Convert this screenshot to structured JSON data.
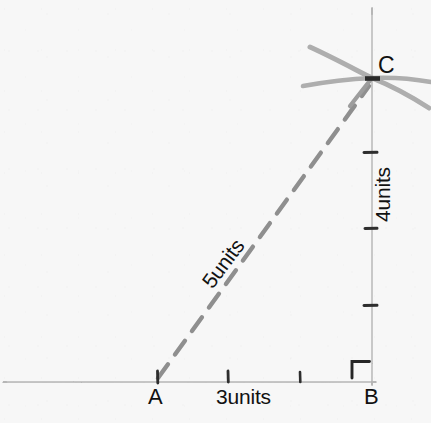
{
  "figure": {
    "kind": "hand-drawn-right-triangle-diagram",
    "background_color": "#f7f7f7",
    "ink_color_light": "#b0b0b0",
    "ink_color_dashed": "#8d8d8d",
    "ink_color_text": "#111111",
    "vertices": {
      "A": {
        "label": "A",
        "x": 157,
        "y": 382
      },
      "B": {
        "label": "B",
        "x": 372,
        "y": 382
      },
      "C": {
        "label": "C",
        "x": 372,
        "y": 78
      }
    },
    "sides": {
      "base": {
        "name": "AB",
        "label": "3units",
        "style": "solid",
        "units": 3
      },
      "height": {
        "name": "BC",
        "label": "4units",
        "style": "solid",
        "units": 4
      },
      "hypotenuse": {
        "name": "AC",
        "label": "5units",
        "style": "dashed",
        "units": 5
      }
    },
    "markers": {
      "right_angle_at": "B",
      "starburst_at": "C",
      "base_tick_count": 3,
      "height_tick_count": 3
    }
  }
}
